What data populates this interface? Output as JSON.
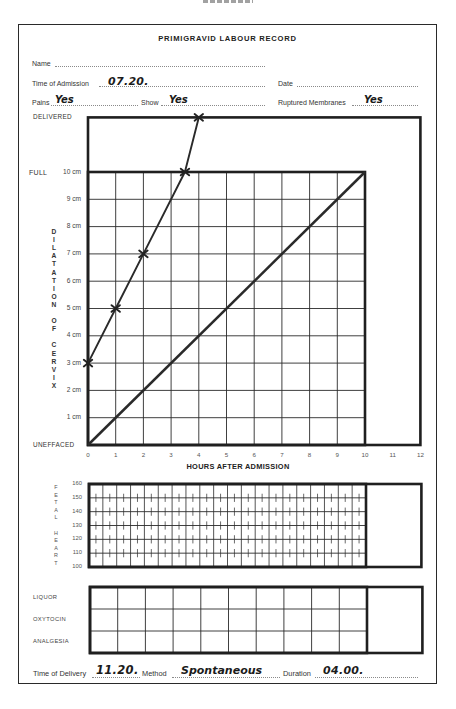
{
  "form": {
    "title": "PRIMIGRAVID LABOUR RECORD",
    "fields": {
      "name": {
        "label": "Name",
        "value": ""
      },
      "time_of_admission": {
        "label": "Time of Admission",
        "value": "07.20."
      },
      "date": {
        "label": "Date",
        "value": ""
      },
      "pains": {
        "label": "Pains",
        "value": "Yes"
      },
      "show": {
        "label": "Show",
        "value": "Yes"
      },
      "ruptured_membranes": {
        "label": "Ruptured Membranes",
        "value": "Yes"
      }
    },
    "footer": {
      "time_of_delivery": {
        "label": "Time of Delivery",
        "value": "11.20."
      },
      "method": {
        "label": "Method",
        "value": "Spontaneous"
      },
      "duration": {
        "label": "Duration",
        "value": "04.00."
      }
    }
  },
  "chart_data": {
    "type": "line",
    "title": "PRIMIGRAVID LABOUR RECORD",
    "xlabel": "HOURS AFTER ADMISSION",
    "ylabel": "DILATATION OF CERVIX",
    "xlim": [
      0,
      12
    ],
    "ylim": [
      0,
      12
    ],
    "grid": true,
    "grid_x_range": [
      0,
      10
    ],
    "grid_y_range": [
      0,
      10
    ],
    "x_ticks": [
      "0",
      "1",
      "2",
      "3",
      "4",
      "5",
      "6",
      "7",
      "8",
      "9",
      "10",
      "11",
      "12"
    ],
    "y_ticks": [
      {
        "value": 0,
        "label": "UNEFFACED"
      },
      {
        "value": 1,
        "label": "1 cm"
      },
      {
        "value": 2,
        "label": "2 cm"
      },
      {
        "value": 3,
        "label": "3 cm"
      },
      {
        "value": 4,
        "label": "4 cm"
      },
      {
        "value": 5,
        "label": "5 cm"
      },
      {
        "value": 6,
        "label": "6 cm"
      },
      {
        "value": 7,
        "label": "7 cm"
      },
      {
        "value": 8,
        "label": "8 cm"
      },
      {
        "value": 9,
        "label": "9 cm"
      },
      {
        "value": 10,
        "label": "10 cm",
        "prefix": "FULL"
      },
      {
        "value": 12,
        "label": "DELIVERED"
      }
    ],
    "series": [
      {
        "name": "recorded dilatation",
        "x": [
          0,
          1,
          2,
          3.5,
          4
        ],
        "y": [
          3,
          5,
          7,
          10,
          12
        ],
        "y_labels": [
          "3 cm",
          "5 cm",
          "7 cm",
          "10 cm (FULL)",
          "DELIVERED"
        ],
        "marker": "x"
      },
      {
        "name": "diagonal",
        "x": [
          0,
          10
        ],
        "y": [
          0,
          10
        ],
        "marker": "none"
      }
    ],
    "legend": null
  },
  "fetal_heart": {
    "label": "FETAL HEART",
    "y_ticks": [
      "160",
      "150",
      "140",
      "130",
      "120",
      "110",
      "100"
    ],
    "y_range": [
      100,
      160
    ],
    "hours": 10
  },
  "drugs_grid": {
    "rows": [
      "LIQUOR",
      "OXYTOCIN",
      "ANALGESIA"
    ],
    "hours": 10
  }
}
